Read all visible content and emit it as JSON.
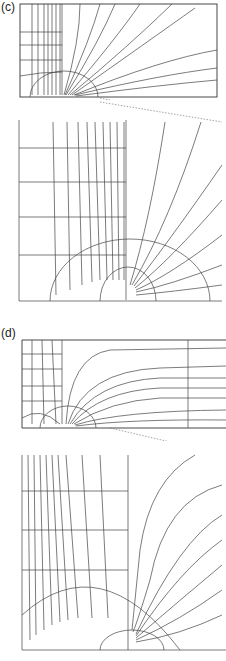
{
  "panels": [
    {
      "label": "(c)",
      "top_contour_labels": [
        "10",
        "10",
        "10",
        "10",
        "10",
        "10",
        "10",
        "8",
        "8",
        "8",
        "0",
        "0",
        "8"
      ],
      "lower_labels": [
        "6",
        "5",
        "4",
        "3",
        "2",
        "1"
      ]
    },
    {
      "label": "(d)",
      "top_contour_labels": [
        "10",
        "10",
        "10",
        "10",
        "10",
        "10",
        "10"
      ],
      "lower_labels": [
        "9",
        "8",
        "7",
        "6",
        "5",
        "4",
        "3",
        "2",
        "1"
      ]
    }
  ]
}
